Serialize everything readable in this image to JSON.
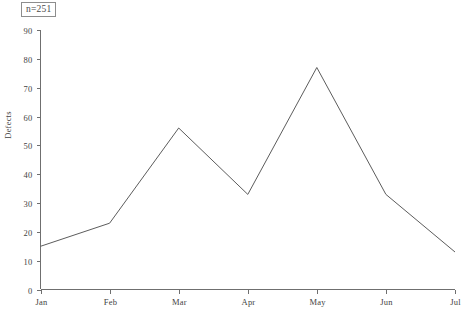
{
  "annotation": {
    "label": "n=251"
  },
  "chart_data": {
    "type": "line",
    "title": "",
    "subtitle": "",
    "xlabel": "",
    "ylabel": "Defects",
    "categories": [
      "Jan",
      "Feb",
      "Mar",
      "Apr",
      "May",
      "Jun",
      "Jul"
    ],
    "values": [
      15,
      23,
      56,
      33,
      77,
      33,
      13
    ],
    "series": [
      {
        "name": "Defects",
        "values": [
          15,
          23,
          56,
          33,
          77,
          33,
          13
        ]
      }
    ],
    "ylim": [
      0,
      90
    ],
    "y_ticks": [
      0,
      10,
      20,
      30,
      40,
      50,
      60,
      70,
      80,
      90
    ],
    "x_ticks": [
      "Jan",
      "Feb",
      "Mar",
      "Apr",
      "May",
      "Jun",
      "Jul"
    ],
    "grid": false,
    "legend": false,
    "legend_position": "none",
    "markers": false,
    "annotations": [
      "n=251"
    ],
    "line_color": "#5c5c5c",
    "axis_color": "#6f6f6f",
    "background_color": "#ffffff"
  }
}
